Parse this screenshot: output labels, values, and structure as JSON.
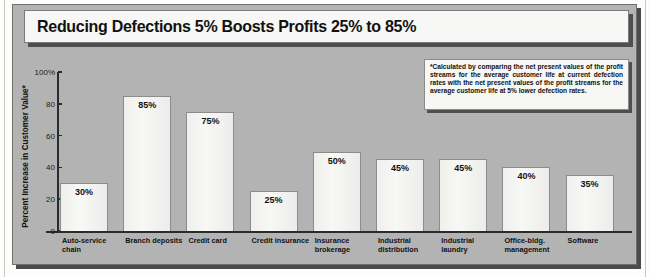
{
  "title": "Reducing Defections 5% Boosts Profits 25% to 85%",
  "footnote": "*Calculated by comparing the net present values of the profit streams for the average customer life at current defection rates with the net present values of the profit streams for the average customer life at 5% lower defection rates.",
  "chart_data": {
    "type": "bar",
    "title": "Reducing Defections 5% Boosts Profits 25% to 85%",
    "xlabel": "",
    "ylabel": "Percent Increase in Customer Value*",
    "ylim": [
      0,
      100
    ],
    "yticks": [
      0,
      20,
      40,
      60,
      80,
      100
    ],
    "ytick_labels": [
      "0",
      "20",
      "40",
      "60",
      "80",
      "100%"
    ],
    "grid": false,
    "legend": "none",
    "categories": [
      "Auto-service chain",
      "Branch deposits",
      "Credit card",
      "Credit insurance",
      "Insurance brokerage",
      "Industrial distribution",
      "Industrial laundry",
      "Office-bldg. management",
      "Software"
    ],
    "values": [
      30,
      85,
      75,
      25,
      50,
      45,
      45,
      40,
      35
    ],
    "data_labels": [
      "30%",
      "85%",
      "75%",
      "25%",
      "50%",
      "45%",
      "45%",
      "40%",
      "35%"
    ],
    "colors": {
      "bar_fill": "#f5f5f2",
      "bar_border": "#8c8c8c",
      "panel_background": "#b3b3b3",
      "axis": "#2b2b2b",
      "text": "#111111"
    }
  }
}
